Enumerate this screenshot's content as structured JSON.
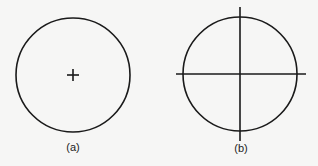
{
  "figures": [
    {
      "id": "a",
      "caption": "(a)",
      "shape": "circle",
      "center": [
        73,
        75
      ],
      "radius": 57,
      "marker": "plus-sign-at-center"
    },
    {
      "id": "b",
      "caption": "(b)",
      "shape": "circle",
      "center": [
        240,
        74
      ],
      "radius": 57,
      "marker": "crosshair-axes-extending-beyond-circle"
    }
  ],
  "colors": {
    "background": "#f6f6f5",
    "stroke": "#1a1a1a"
  }
}
